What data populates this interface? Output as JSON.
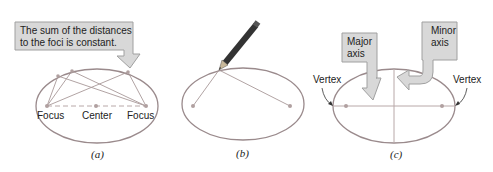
{
  "figure": {
    "panels": [
      {
        "id": "a",
        "caption": "(a)",
        "callout": {
          "line1": "The sum of the distances",
          "line2": "to the foci is constant."
        },
        "labels": {
          "left_focus": "Focus",
          "center": "Center",
          "right_focus": "Focus"
        }
      },
      {
        "id": "b",
        "caption": "(b)",
        "description": "Pencil drawing ellipse with string fixed at foci"
      },
      {
        "id": "c",
        "caption": "(c)",
        "labels": {
          "major_axis_line1": "Major",
          "major_axis_line2": "axis",
          "minor_axis_line1": "Minor",
          "minor_axis_line2": "axis",
          "left_vertex": "Vertex",
          "right_vertex": "Vertex"
        }
      }
    ],
    "colors": {
      "ellipse_stroke": "#9a8a8c",
      "focus_dot": "#b0a0a0",
      "line": "#a89898",
      "callout_fill": "#d8d8d8",
      "callout_stroke": "#a0a0a0",
      "text": "#222222"
    }
  }
}
